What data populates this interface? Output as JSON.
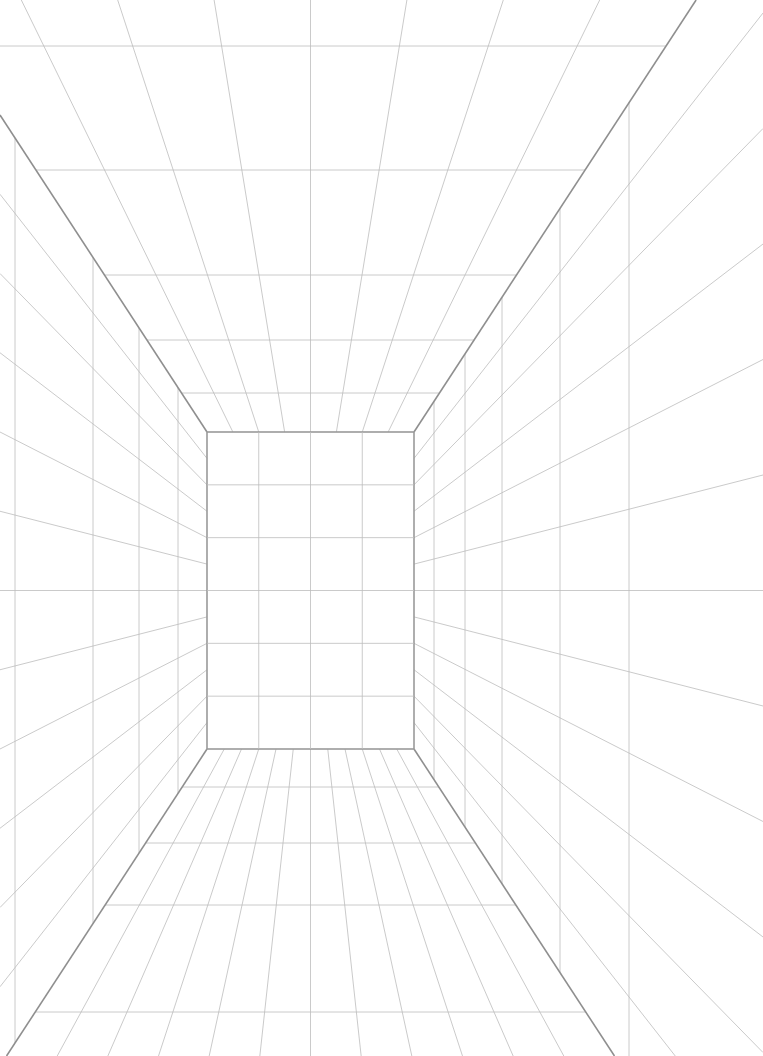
{
  "colors": {
    "background": "#ffffff",
    "grid_line": "#bdbdbd",
    "edge_line": "#8f8f8f"
  },
  "vanishing_point": {
    "x": 310.5,
    "y": 590.5
  },
  "back_wall": {
    "x1": 207,
    "y1": 432,
    "x2": 414,
    "y2": 749,
    "columns": 4,
    "rows": 6
  },
  "ceiling_rows_y": [
    46,
    170,
    275,
    340,
    393
  ],
  "floor_rows_y": [
    787,
    843,
    905,
    1012
  ],
  "left_wall_cols_x": [
    15,
    93,
    139,
    178
  ],
  "right_wall_cols_x": [
    434,
    465,
    502,
    560,
    629
  ],
  "wall_radials": 13,
  "ceiling_radials": 9,
  "floor_radials": 13
}
